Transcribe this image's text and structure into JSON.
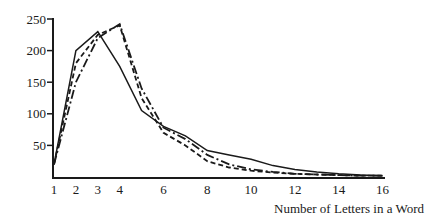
{
  "chart_data": {
    "type": "line",
    "title": "",
    "xlabel": "Number of Letters in a Word",
    "ylabel": "",
    "x": [
      1,
      2,
      3,
      4,
      5,
      6,
      7,
      8,
      9,
      10,
      11,
      12,
      13,
      14,
      15,
      16
    ],
    "xticks": [
      1,
      2,
      3,
      4,
      6,
      8,
      10,
      12,
      14,
      16
    ],
    "yticks": [
      50,
      100,
      150,
      200,
      250
    ],
    "xlim": [
      1,
      16
    ],
    "ylim": [
      0,
      250
    ],
    "grid": false,
    "legend": "none",
    "series": [
      {
        "name": "solid",
        "style": "solid",
        "values": [
          20,
          200,
          230,
          175,
          105,
          80,
          65,
          42,
          35,
          28,
          18,
          12,
          8,
          5,
          3,
          2
        ]
      },
      {
        "name": "short-dash",
        "style": "dashed",
        "values": [
          20,
          180,
          225,
          240,
          125,
          70,
          50,
          25,
          15,
          10,
          7,
          5,
          4,
          3,
          2,
          2
        ]
      },
      {
        "name": "dash-dot",
        "style": "dash-dot",
        "values": [
          20,
          150,
          220,
          242,
          140,
          78,
          60,
          35,
          20,
          12,
          8,
          5,
          4,
          3,
          2,
          2
        ]
      }
    ]
  },
  "colors": {
    "ink": "#1a1a1a",
    "background": "#ffffff"
  }
}
